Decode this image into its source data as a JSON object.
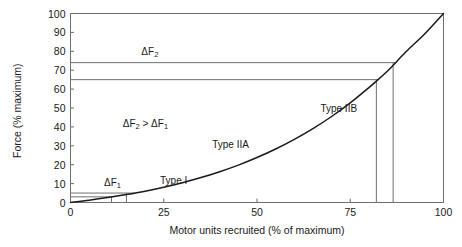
{
  "chart_data": {
    "type": "line",
    "title": "",
    "xlabel": "Motor units recruited (% of maximum)",
    "ylabel": "Force (% maximum)",
    "xlim": [
      0,
      100
    ],
    "ylim": [
      0,
      100
    ],
    "grid": false,
    "frame": "box",
    "xticks": [
      "0",
      "25",
      "50",
      "75",
      "100"
    ],
    "xtick_values": [
      0,
      25,
      50,
      75,
      100
    ],
    "yticks": [
      "0",
      "10",
      "20",
      "30",
      "40",
      "50",
      "60",
      "70",
      "80",
      "90",
      "100"
    ],
    "ytick_values": [
      0,
      10,
      20,
      30,
      40,
      50,
      60,
      70,
      80,
      90,
      100
    ],
    "series": [
      {
        "name": "Force recruitment curve",
        "x": [
          0,
          5,
          10,
          15,
          20,
          25,
          30,
          35,
          40,
          45,
          50,
          55,
          60,
          65,
          70,
          75,
          80,
          82,
          85,
          86.5,
          90,
          95,
          100
        ],
        "values": [
          0,
          1.2,
          2.6,
          4.2,
          6.0,
          8.1,
          10.5,
          13.2,
          16.3,
          19.8,
          23.8,
          28.3,
          33.4,
          39.1,
          45.5,
          52.7,
          60.8,
          64.2,
          69.6,
          72.6,
          79.9,
          89.3,
          100
        ]
      }
    ],
    "reference_lines": {
      "horizontal": [
        {
          "y": 3,
          "label": "",
          "note": "lower bound of delta-F1 band"
        },
        {
          "y": 5,
          "label": "",
          "note": "upper bound of delta-F1 band"
        },
        {
          "y": 65,
          "label": "",
          "note": "lower bound of delta-F2 band"
        },
        {
          "y": 74,
          "label": "",
          "note": "upper bound of delta-F2 band"
        }
      ],
      "vertical": [
        {
          "x": 11,
          "from_y": 0,
          "to_y": 3
        },
        {
          "x": 15,
          "from_y": 0,
          "to_y": 5
        },
        {
          "x": 82,
          "from_y": 0,
          "to_y": 65
        },
        {
          "x": 86.5,
          "from_y": 0,
          "to_y": 74
        }
      ]
    },
    "annotations": [
      {
        "id": "delta-f2",
        "text_html": "ΔF<sub>2</sub>",
        "text": "ΔF2",
        "x": 19,
        "y": 79
      },
      {
        "id": "delta-f2-gt-f1",
        "text_html": "ΔF<sub>2</sub> > ΔF<sub>1</sub>",
        "text": "ΔF2 > ΔF1",
        "x": 14,
        "y": 41
      },
      {
        "id": "delta-f1",
        "text_html": "ΔF<sub>1</sub>",
        "text": "ΔF1",
        "x": 9,
        "y": 10
      },
      {
        "id": "type-i",
        "text": "Type I",
        "x": 24,
        "y": 11
      },
      {
        "id": "type-iia",
        "text": "Type IIA",
        "x": 38,
        "y": 30
      },
      {
        "id": "type-iib",
        "text": "Type IIB",
        "x": 67,
        "y": 49
      }
    ]
  },
  "axis_titles": {
    "x": "Motor units recruited (% of maximum)",
    "y": "Force (% maximum)"
  },
  "colors": {
    "curve": "#1a1a1a",
    "frame": "#6f6f6f",
    "reference": "#6f6f6f",
    "text": "#1a1a1a",
    "background": "#ffffff"
  }
}
